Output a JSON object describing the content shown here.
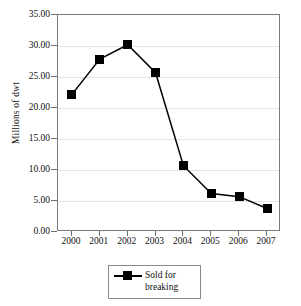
{
  "chart_data": {
    "type": "line",
    "title": "",
    "xlabel": "",
    "ylabel": "Millions of dwt",
    "categories": [
      "2000",
      "2001",
      "2002",
      "2003",
      "2004",
      "2005",
      "2006",
      "2007"
    ],
    "series": [
      {
        "name": "Sold for breaking",
        "values": [
          22.2,
          27.9,
          30.2,
          25.7,
          10.7,
          6.2,
          5.7,
          3.8
        ],
        "marker": "square",
        "marker_color": "#000000",
        "line_color": "#000000"
      }
    ],
    "ylim": [
      0,
      35
    ],
    "yticks": [
      0,
      5,
      10,
      15,
      20,
      25,
      30,
      35
    ],
    "ytick_labels": [
      "0.00",
      "5.00",
      "10.00",
      "15.00",
      "20.00",
      "25.00",
      "30.00",
      "35.00"
    ],
    "xtick_labels": [
      "2000",
      "2001",
      "2002",
      "2003",
      "2004",
      "2005",
      "2006",
      "2007"
    ],
    "grid": "horizontal",
    "grid_color": "#e3e3e3",
    "legend_position": "bottom-center",
    "legend_entries": [
      "Sold for breaking"
    ],
    "axis_color": "#7a7a7a",
    "background": "#ffffff"
  },
  "legend": {
    "label_line1": "Sold for",
    "label_line2": "breaking",
    "label_full": "Sold for\nbreaking"
  },
  "axes": {
    "y_title": "Millions of dwt"
  }
}
